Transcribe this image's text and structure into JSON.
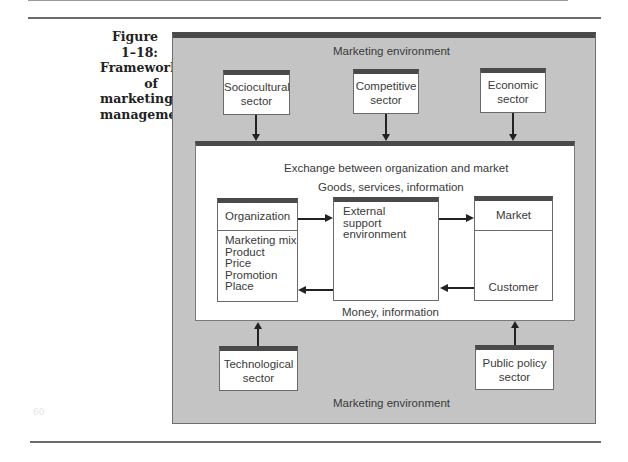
{
  "caption": {
    "line1": "Figure 1–18:",
    "line2": "Framework of",
    "line3": "marketing",
    "line4": "management"
  },
  "outer": {
    "top_label": "Marketing environment",
    "bottom_label": "Marketing environment"
  },
  "sectors": {
    "sociocultural": {
      "line1": "Sociocultural",
      "line2": "sector"
    },
    "competitive": {
      "line1": "Competitive",
      "line2": "sector"
    },
    "economic": {
      "line1": "Economic",
      "line2": "sector"
    },
    "technological": {
      "line1": "Technological",
      "line2": "sector"
    },
    "public_policy": {
      "line1": "Public policy",
      "line2": "sector"
    }
  },
  "exchange": {
    "title": "Exchange between organization and market",
    "top_flow": "Goods, services, information",
    "bottom_flow": "Money, information"
  },
  "organization": {
    "title": "Organization",
    "mix": [
      "Marketing mix",
      "Product",
      "Price",
      "Promotion",
      "Place"
    ]
  },
  "external": {
    "line1": "External",
    "line2": "support",
    "line3": "environment"
  },
  "market": {
    "title": "Market",
    "bottom": "Customer"
  },
  "page_number_ghost": "60",
  "colors": {
    "environment_fill": "#c4c4c4",
    "header_bar": "#4a4a4a",
    "box_fill": "#ffffff"
  }
}
